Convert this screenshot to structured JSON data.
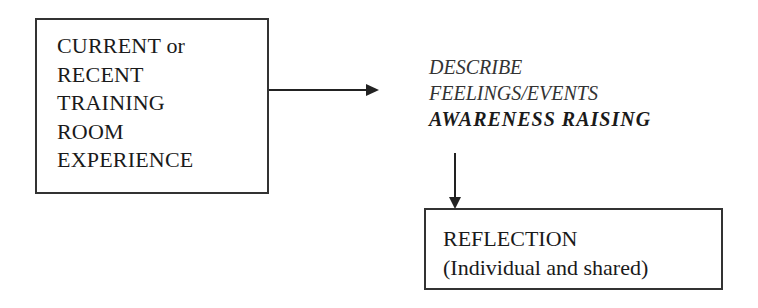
{
  "diagram": {
    "experience_box": {
      "lines": [
        "CURRENT or",
        "RECENT",
        "TRAINING",
        "ROOM",
        "EXPERIENCE"
      ]
    },
    "describe_stage": {
      "line1": "DESCRIBE",
      "line2": "FEELINGS/EVENTS",
      "line3": "AWARENESS RAISING"
    },
    "reflection_box": {
      "title": "REFLECTION",
      "subtitle": "(Individual and shared)"
    },
    "connectors": [
      {
        "from": "experience_box",
        "to": "describe_stage",
        "direction": "right"
      },
      {
        "from": "describe_stage",
        "to": "reflection_box",
        "direction": "down"
      }
    ]
  }
}
